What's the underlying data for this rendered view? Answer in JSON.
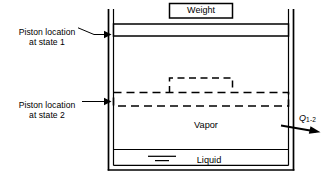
{
  "figure": {
    "stroke_color": "#000000",
    "background_color": "#ffffff"
  },
  "labels": {
    "weight": "Weight",
    "vapor": "Vapor",
    "liquid": "Liquid",
    "piston_state_1_line_1": "Piston location",
    "piston_state_1_line_2": "at state 1",
    "piston_state_2_line_1": "Piston location",
    "piston_state_2_line_2": "at state 2",
    "heat_transfer_symbol": "Q",
    "heat_transfer_subscript": "1-2"
  },
  "annotations": {
    "state_1_piston_style": "solid",
    "state_2_piston_style": "dashed",
    "heat_direction": "out-of-cylinder-to-the-right"
  }
}
